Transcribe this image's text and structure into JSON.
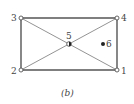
{
  "diagram": {
    "caption": "(b)",
    "nodes": [
      {
        "id": "1",
        "label": "1",
        "x": 117,
        "y": 70,
        "filled": false
      },
      {
        "id": "2",
        "label": "2",
        "x": 21,
        "y": 70,
        "filled": false
      },
      {
        "id": "3",
        "label": "3",
        "x": 21,
        "y": 18,
        "filled": false
      },
      {
        "id": "4",
        "label": "4",
        "x": 117,
        "y": 18,
        "filled": false
      },
      {
        "id": "5",
        "label": "5",
        "x": 69,
        "y": 44,
        "filled": "half"
      },
      {
        "id": "6",
        "label": "6",
        "x": 103,
        "y": 44,
        "filled": true
      }
    ],
    "edges": [
      {
        "from": "3",
        "to": "4",
        "weight": "thick"
      },
      {
        "from": "4",
        "to": "1",
        "weight": "thick"
      },
      {
        "from": "1",
        "to": "2",
        "weight": "thick"
      },
      {
        "from": "2",
        "to": "3",
        "weight": "thick"
      },
      {
        "from": "3",
        "to": "1",
        "weight": "thin"
      },
      {
        "from": "2",
        "to": "4",
        "weight": "thin"
      }
    ],
    "colors": {
      "line": "#555555",
      "node_fill": "#ffffff",
      "node_dark": "#222222"
    }
  }
}
